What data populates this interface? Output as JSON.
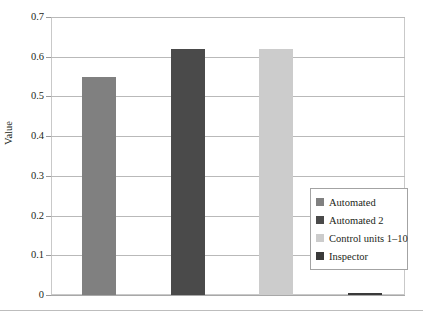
{
  "chart_data": {
    "type": "bar",
    "title": "",
    "subtitle": "",
    "xlabel": "",
    "ylabel": "Value",
    "ylim": [
      0,
      0.7
    ],
    "ytick_labels": [
      "0.7",
      "0.6",
      "0.5",
      "0.4",
      "0.3",
      "0.2",
      "0.1",
      "0"
    ],
    "ytick_values": [
      0.7,
      0.6,
      0.5,
      0.4,
      0.3,
      0.2,
      0.1,
      0
    ],
    "grid": true,
    "legend_position": "right-inside",
    "categories": [
      "Automated",
      "Automated 2",
      "Control units 1–10",
      "Inspector"
    ],
    "values": [
      0.55,
      0.62,
      0.62,
      0.005
    ],
    "colors": [
      "#808080",
      "#4a4a4a",
      "#cccccc",
      "#3a3a3a"
    ],
    "series": [
      {
        "name": "Value",
        "values": [
          0.55,
          0.62,
          0.62,
          0.005
        ]
      }
    ]
  },
  "axis": {
    "y_title": "Value",
    "ticks": [
      {
        "label": "0.7",
        "value": 0.7
      },
      {
        "label": "0.6",
        "value": 0.6
      },
      {
        "label": "0.5",
        "value": 0.5
      },
      {
        "label": "0.4",
        "value": 0.4
      },
      {
        "label": "0.3",
        "value": 0.3
      },
      {
        "label": "0.2",
        "value": 0.2
      },
      {
        "label": "0.1",
        "value": 0.1
      },
      {
        "label": "0",
        "value": 0
      }
    ]
  },
  "legend": {
    "items": [
      {
        "label": "Automated",
        "color": "#808080"
      },
      {
        "label": "Automated 2",
        "color": "#4a4a4a"
      },
      {
        "label": "Control units 1–10",
        "color": "#cccccc"
      },
      {
        "label": "Inspector",
        "color": "#3a3a3a"
      }
    ]
  }
}
